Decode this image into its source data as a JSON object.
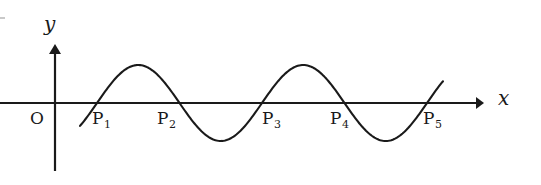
{
  "figure": {
    "background_color": "#ffffff",
    "stroke_color": "#1a1a1a",
    "width": 541,
    "height": 185
  },
  "axes": {
    "x_axis": {
      "label": "x",
      "label_x": 498,
      "label_y": 88,
      "line_x1": 0,
      "line_x2": 476,
      "line_y": 103,
      "arrow_tip_x": 484,
      "arrow_head_half_height": 6
    },
    "y_axis": {
      "label": "y",
      "label_x": 44,
      "label_y": 14,
      "line_x": 55,
      "line_y1": 52,
      "line_y2": 171,
      "arrow_tip_y": 44,
      "arrow_head_half_width": 6
    },
    "origin": {
      "label": "O",
      "label_x": 30,
      "label_y": 110,
      "x": 55,
      "y": 103
    },
    "edge_tick": {
      "x1": 0,
      "x2": 5,
      "y": 18,
      "color": "#c9c9c9"
    }
  },
  "points": [
    {
      "label": "P",
      "subscript": "1",
      "x": 97,
      "label_x": 92,
      "label_y": 110
    },
    {
      "label": "P",
      "subscript": "2",
      "x": 179,
      "label_x": 157,
      "label_y": 110
    },
    {
      "label": "P",
      "subscript": "3",
      "x": 262,
      "label_x": 262,
      "label_y": 110
    },
    {
      "label": "P",
      "subscript": "4",
      "x": 344,
      "label_x": 330,
      "label_y": 110
    },
    {
      "label": "P",
      "subscript": "5",
      "x": 428,
      "label_x": 423,
      "label_y": 110
    }
  ],
  "chart_data": {
    "type": "line",
    "xlabel": "x",
    "ylabel": "y",
    "grid": false,
    "legend": "none",
    "curve": {
      "name": "sine wave",
      "form": "y = A*sin(2*pi*(x - x0)/T)",
      "amplitude_px": 38,
      "period_px": 165,
      "baseline_y_px": 103,
      "start_point": {
        "x": 80,
        "y": 120
      },
      "end_point": {
        "x": 443,
        "y": 78
      },
      "zero_crossings_px": [
        97,
        179,
        262,
        344,
        428
      ],
      "maxima_px": [
        {
          "x": 138,
          "y": 65
        },
        {
          "x": 303,
          "y": 65
        }
      ],
      "minima_px": [
        {
          "x": 220,
          "y": 141
        },
        {
          "x": 386,
          "y": 141
        }
      ]
    },
    "x_tick_labels": [
      "P1",
      "P2",
      "P3",
      "P4",
      "P5"
    ],
    "x_tick_values_px": [
      97,
      179,
      262,
      344,
      428
    ],
    "y_tick_labels": [],
    "annotations": [
      "O",
      "x",
      "y"
    ]
  }
}
